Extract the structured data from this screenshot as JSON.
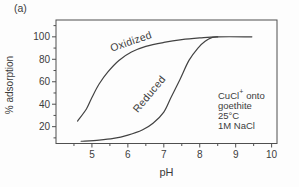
{
  "figure_label": "(a)",
  "colors": {
    "background": "#fdfdfd",
    "line": "#424242",
    "frame": "#4f4f4f",
    "text": "#3c3c3c"
  },
  "chart_data": {
    "type": "line",
    "title": "",
    "xlabel": "pH",
    "ylabel": "% adsorption",
    "xlim": [
      4.0,
      10.15
    ],
    "ylim": [
      5,
      115
    ],
    "x_major_ticks": [
      5,
      6,
      7,
      8,
      9,
      10
    ],
    "x_minor_ticks": [
      4.5,
      5.5,
      6.5,
      7.5,
      8.5,
      9.5
    ],
    "y_major_ticks": [
      20,
      40,
      60,
      80,
      100
    ],
    "y_minor_ticks": [
      10,
      30,
      50,
      70,
      90,
      110
    ],
    "grid": false,
    "legend_position": "none",
    "series": [
      {
        "name": "Oxidized",
        "points": [
          [
            4.6,
            25
          ],
          [
            4.85,
            36
          ],
          [
            5.0,
            46
          ],
          [
            5.2,
            58
          ],
          [
            5.45,
            69
          ],
          [
            5.75,
            79
          ],
          [
            6.1,
            86.5
          ],
          [
            6.5,
            91.5
          ],
          [
            7.0,
            95
          ],
          [
            7.5,
            97.5
          ],
          [
            8.0,
            99
          ],
          [
            8.5,
            100
          ],
          [
            9.45,
            100
          ]
        ]
      },
      {
        "name": "Reduced",
        "points": [
          [
            4.7,
            7
          ],
          [
            5.2,
            8
          ],
          [
            5.6,
            9.5
          ],
          [
            6.0,
            12.5
          ],
          [
            6.4,
            17
          ],
          [
            6.7,
            23
          ],
          [
            7.0,
            33
          ],
          [
            7.2,
            46
          ],
          [
            7.45,
            62
          ],
          [
            7.7,
            79
          ],
          [
            7.95,
            90
          ],
          [
            8.15,
            96
          ],
          [
            8.35,
            99.5
          ],
          [
            8.5,
            100
          ]
        ]
      }
    ],
    "curve_labels": [
      {
        "text": "Oxidized",
        "x": 6.12,
        "y": 93,
        "angle": -19
      },
      {
        "text": "Reduced",
        "x": 6.67,
        "y": 47,
        "angle": -50
      }
    ],
    "annotation": {
      "line1_main": "CuCl",
      "line1_sup": "+",
      "line1_rest": "onto",
      "line2": "goethite",
      "line3": "25°C",
      "line4": "1M NaCl"
    }
  }
}
